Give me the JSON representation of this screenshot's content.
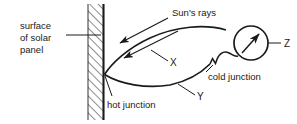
{
  "figure": {
    "type": "physics-diagram",
    "background_color": "#ffffff",
    "ink_color": "#1a1a1a"
  },
  "labels": {
    "surface_line1": "surface",
    "surface_line2": "of solar",
    "surface_line3": "panel",
    "suns_rays": "Sun's rays",
    "hot_junction": "hot junction",
    "cold_junction": "cold junction",
    "wire_x": "X",
    "wire_y": "Y",
    "meter_z": "Z"
  },
  "elements": {
    "wall": {
      "name": "solar-panel-surface",
      "hatch_angle_deg": 45,
      "x_left": 88,
      "x_right": 104,
      "y_top": 4,
      "y_bottom": 120
    },
    "rays": [
      {
        "name": "sun-ray-upper",
        "from": [
          168,
          18
        ],
        "to": [
          118,
          44
        ]
      },
      {
        "name": "sun-ray-lower",
        "from": [
          178,
          30
        ],
        "to": [
          122,
          58
        ]
      }
    ],
    "meter": {
      "name": "galvanometer",
      "center": [
        251,
        43
      ],
      "radius": 17,
      "needle_from": [
        243,
        52
      ],
      "needle_to": [
        259,
        34
      ]
    },
    "junctions": {
      "hot": [
        104,
        74
      ],
      "cold": [
        215,
        60
      ]
    }
  },
  "leaders": {
    "surface": {
      "from": [
        66,
        34
      ],
      "to": [
        101,
        35
      ]
    },
    "hot_junction": {
      "from": [
        112,
        96
      ],
      "to": [
        105,
        76
      ]
    },
    "cold_junction": {
      "from": [
        213,
        64
      ],
      "to": [
        206,
        72
      ]
    },
    "wire_x": {
      "from": [
        169,
        56
      ],
      "to": [
        186,
        66
      ]
    },
    "wire_y": {
      "from": [
        196,
        86
      ],
      "to": [
        211,
        96
      ]
    },
    "meter_z": {
      "from": [
        268,
        43
      ],
      "to": [
        283,
        43
      ]
    }
  }
}
